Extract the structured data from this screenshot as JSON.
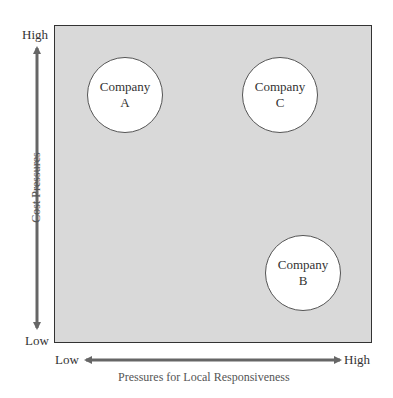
{
  "diagram": {
    "y_axis": {
      "title": "Cost Pressures",
      "high_label": "High",
      "low_label": "Low"
    },
    "x_axis": {
      "title": "Pressures for Local Responsiveness",
      "high_label": "High",
      "low_label": "Low"
    },
    "companies": [
      {
        "line1": "Company",
        "line2": "A",
        "position": "high cost, low local responsiveness"
      },
      {
        "line1": "Company",
        "line2": "C",
        "position": "high cost, high local responsiveness"
      },
      {
        "line1": "Company",
        "line2": "B",
        "position": "low cost, high local responsiveness"
      }
    ],
    "colors": {
      "plot_fill": "#d9d9d9",
      "circle_fill": "#ffffff",
      "arrow": "#666666",
      "border": "#333333"
    }
  }
}
